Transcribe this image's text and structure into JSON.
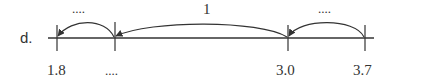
{
  "problem": {
    "label": "d.",
    "number_line": {
      "ticks": [
        {
          "value": "1.8",
          "x": 57
        },
        {
          "value": "....",
          "x": 115
        },
        {
          "value": "3.0",
          "x": 288
        },
        {
          "value": "3.7",
          "x": 365
        }
      ]
    },
    "jumps": [
      {
        "label": "....",
        "from_tick": 1,
        "to_tick": 0
      },
      {
        "label": "1",
        "from_tick": 2,
        "to_tick": 1
      },
      {
        "label": "....",
        "from_tick": 3,
        "to_tick": 2
      }
    ],
    "colors": {
      "ink": "#333333"
    }
  }
}
